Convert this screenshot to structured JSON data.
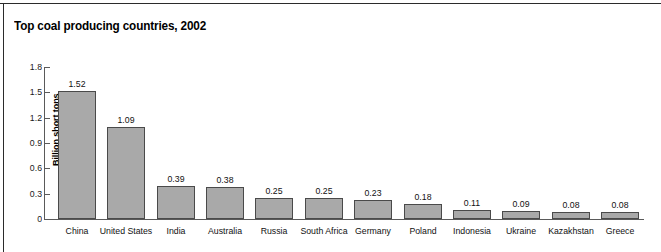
{
  "figure": {
    "title": "Top coal producing countries, 2002"
  },
  "chart_data": {
    "type": "bar",
    "title": "Top coal producing countries, 2002",
    "xlabel": "",
    "ylabel": "Billion short tons",
    "ylim": [
      0,
      1.8
    ],
    "yticks": [
      "0",
      "0.3",
      "0.6",
      "0.9",
      "1.2",
      "1.5",
      "1.8"
    ],
    "ytick_values": [
      0,
      0.3,
      0.6,
      0.9,
      1.2,
      1.5,
      1.8
    ],
    "grid": false,
    "legend": null,
    "bar_color": "#a9a9a9",
    "bar_edge_color": "#4a4a4a",
    "categories": [
      "China",
      "United States",
      "India",
      "Australia",
      "Russia",
      "South Africa",
      "Germany",
      "Poland",
      "Indonesia",
      "Ukraine",
      "Kazakhstan",
      "Greece"
    ],
    "values": [
      1.52,
      1.09,
      0.39,
      0.38,
      0.25,
      0.25,
      0.23,
      0.18,
      0.11,
      0.09,
      0.08,
      0.08
    ],
    "value_labels": [
      "1.52",
      "1.09",
      "0.39",
      "0.38",
      "0.25",
      "0.25",
      "0.23",
      "0.18",
      "0.11",
      "0.09",
      "0.08",
      "0.08"
    ]
  }
}
